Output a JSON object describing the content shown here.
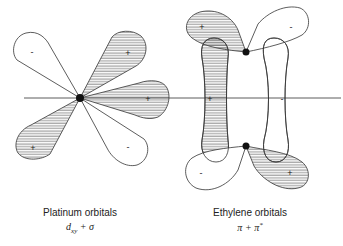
{
  "platinum": {
    "caption": "Platinum orbitals",
    "formula": {
      "term1_symbol": "d",
      "term1_subscript": "xy",
      "operator": "+",
      "term2_symbol": "σ"
    },
    "lobe_signs": {
      "upper_left": "-",
      "upper_right": "+",
      "right": "+",
      "lower_left": "+",
      "lower_right": "-"
    }
  },
  "ethylene": {
    "caption": "Ethylene orbitals",
    "formula": {
      "term1_symbol": "π",
      "operator": "+",
      "term2_symbol": "π",
      "term2_superscript": "*"
    },
    "lobe_signs": {
      "top_left": "+",
      "top_right": "-",
      "left_bar": "+",
      "right_bar": "-",
      "bottom_left": "-",
      "bottom_right": "+"
    }
  },
  "colors": {
    "line": "#333333",
    "hatch": "#555555",
    "background": "#ffffff"
  }
}
